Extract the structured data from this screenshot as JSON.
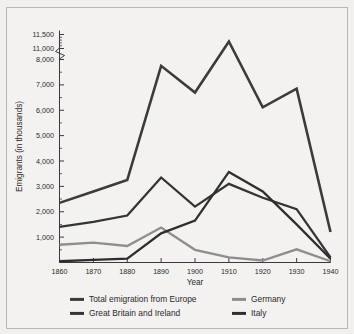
{
  "chart_data": {
    "type": "line",
    "title": "",
    "xlabel": "Year",
    "ylabel": "Emigrants (in thousands)",
    "x": [
      1860,
      1870,
      1880,
      1890,
      1900,
      1910,
      1920,
      1930,
      1940
    ],
    "xtick_labels": [
      "1860",
      "1870",
      "1880",
      "1890",
      "1900",
      "1910",
      "1920",
      "1930",
      "1940"
    ],
    "ytick_labels": [
      "1,000",
      "2,000",
      "3,000",
      "4,000",
      "5,000",
      "6,000",
      "7,000",
      "8,000",
      "11,000",
      "11,500"
    ],
    "ytick_values": [
      1000,
      2000,
      3000,
      4000,
      5000,
      6000,
      7000,
      8000,
      11000,
      11500
    ],
    "axis_break": true,
    "axis_break_between": [
      8000,
      11000
    ],
    "xlim": [
      1860,
      1940
    ],
    "ylim": [
      0,
      11500
    ],
    "grid": false,
    "legend_position": "bottom",
    "series": [
      {
        "name": "Total emigration from Europe",
        "color": "#3b3b3b",
        "width": 2.6,
        "values": [
          2350,
          2800,
          3250,
          7750,
          6700,
          11250,
          8900,
          6850,
          1200
        ]
      },
      {
        "name": "Great Britain and Ireland",
        "color": "#343434",
        "width": 2.3,
        "values": [
          1400,
          1600,
          1850,
          3350,
          2200,
          3100,
          2550,
          2100,
          200
        ]
      },
      {
        "name": "Germany",
        "color": "#8e8e8e",
        "width": 2.3,
        "values": [
          700,
          780,
          650,
          1380,
          500,
          200,
          80,
          520,
          50
        ]
      },
      {
        "name": "Italy",
        "color": "#2e2e2e",
        "width": 2.3,
        "values": [
          50,
          100,
          150,
          1150,
          1650,
          3570,
          2800,
          1500,
          150
        ]
      }
    ],
    "legend": [
      {
        "label": "Total emigration from Europe",
        "color": "#3b3b3b",
        "column": "left",
        "row": 0
      },
      {
        "label": "Great Britain and Ireland",
        "color": "#343434",
        "column": "left",
        "row": 1
      },
      {
        "label": "Germany",
        "color": "#8e8e8e",
        "column": "right",
        "row": 0
      },
      {
        "label": "Italy",
        "color": "#2e2e2e",
        "column": "right",
        "row": 1
      }
    ]
  }
}
